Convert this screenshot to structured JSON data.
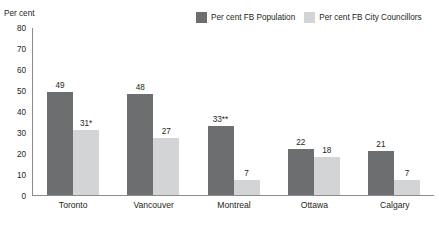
{
  "chart_data": {
    "type": "bar",
    "title": "",
    "xlabel": "",
    "ylabel": "Per cent",
    "ylim": [
      0,
      80
    ],
    "yticks": [
      80,
      70,
      60,
      50,
      40,
      30,
      20,
      10,
      0
    ],
    "grid": false,
    "legend_position": "top-right",
    "categories": [
      "Toronto",
      "Vancouver",
      "Montreal",
      "Ottawa",
      "Calgary"
    ],
    "series": [
      {
        "name": "Per cent FB Population",
        "color": "#6d6e70",
        "values": [
          49,
          48,
          33,
          22,
          21
        ],
        "labels": [
          "49",
          "48",
          "33**",
          "22",
          "21"
        ]
      },
      {
        "name": "Per cent FB City Councillors",
        "color": "#d3d4d5",
        "values": [
          31,
          27,
          7,
          18,
          7
        ],
        "labels": [
          "31*",
          "27",
          "7",
          "18",
          "7"
        ]
      }
    ]
  },
  "axis": {
    "y_title": "Per cent"
  },
  "colors": {
    "series_dark": "#6d6e70",
    "series_light": "#d3d4d5",
    "axis_line": "#8c8c8c",
    "text": "#231f20",
    "background": "#ffffff"
  }
}
